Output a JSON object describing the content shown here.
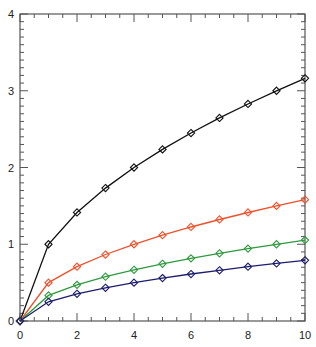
{
  "chart_data": {
    "type": "line",
    "title": "",
    "xlabel": "",
    "ylabel": "",
    "xlim": [
      0,
      10
    ],
    "ylim": [
      0,
      4
    ],
    "grid": false,
    "legend": null,
    "x_ticks": [
      0,
      2,
      4,
      6,
      8,
      10
    ],
    "y_ticks": [
      0,
      1,
      2,
      3,
      4
    ],
    "x": [
      0,
      1,
      2,
      3,
      4,
      5,
      6,
      7,
      8,
      9,
      10
    ],
    "marker": "diamond",
    "series": [
      {
        "name": "black",
        "color": "#111111",
        "values": [
          0,
          1.0,
          1.414,
          1.732,
          2.0,
          2.236,
          2.449,
          2.646,
          2.828,
          3.0,
          3.162
        ]
      },
      {
        "name": "red",
        "color": "#f0502a",
        "values": [
          0,
          0.5,
          0.707,
          0.866,
          1.0,
          1.118,
          1.225,
          1.323,
          1.414,
          1.5,
          1.581
        ]
      },
      {
        "name": "green",
        "color": "#2e9a3e",
        "values": [
          0,
          0.333,
          0.471,
          0.577,
          0.667,
          0.745,
          0.816,
          0.882,
          0.943,
          1.0,
          1.054
        ]
      },
      {
        "name": "navy",
        "color": "#1c1c70",
        "values": [
          0,
          0.25,
          0.354,
          0.433,
          0.5,
          0.559,
          0.612,
          0.661,
          0.707,
          0.75,
          0.791
        ]
      }
    ]
  }
}
